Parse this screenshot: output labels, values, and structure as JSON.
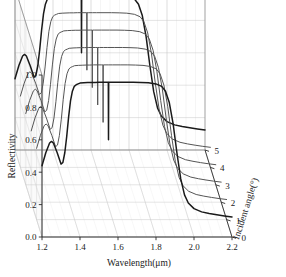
{
  "chart_data": {
    "type": "line",
    "render": "3d-waterfall",
    "title": "",
    "xlabel": "Wavelength(μm)",
    "ylabel": "Reflectivity",
    "zlabel": "Incident angle(°)",
    "xlim": [
      1.2,
      2.2
    ],
    "ylim": [
      0.0,
      1.0
    ],
    "zlim": [
      0,
      5
    ],
    "xticks": [
      "1.2",
      "1.4",
      "1.6",
      "1.8",
      "2.0",
      "2.2"
    ],
    "xtickvals": [
      1.2,
      1.4,
      1.6,
      1.8,
      2.0,
      2.2
    ],
    "yticks": [
      "0.0",
      "0.2",
      "0.4",
      "0.6",
      "0.8",
      "1.0"
    ],
    "ytickvals": [
      0.0,
      0.2,
      0.4,
      0.6,
      0.8,
      1.0
    ],
    "zticks": [
      "0",
      "1",
      "2",
      "3",
      "4",
      "5"
    ],
    "ztickvals": [
      0,
      1,
      2,
      3,
      4,
      5
    ],
    "grid": true,
    "legend": false,
    "line_color": "#222222",
    "notch_wavelength": 1.55,
    "series": [
      {
        "name": "0",
        "angle": 0,
        "color": "#1a1a1a",
        "x": [
          1.2,
          1.22,
          1.24,
          1.25,
          1.26,
          1.28,
          1.3,
          1.31,
          1.32,
          1.33,
          1.34,
          1.35,
          1.36,
          1.37,
          1.38,
          1.39,
          1.4,
          1.42,
          1.44,
          1.46,
          1.48,
          1.5,
          1.52,
          1.54,
          1.549,
          1.55,
          1.551,
          1.56,
          1.58,
          1.6,
          1.64,
          1.68,
          1.72,
          1.76,
          1.8,
          1.83,
          1.85,
          1.87,
          1.89,
          1.91,
          1.93,
          1.95,
          1.97,
          2.0,
          2.04,
          2.08,
          2.12,
          2.16,
          2.2
        ],
        "y": [
          0.44,
          0.52,
          0.58,
          0.59,
          0.58,
          0.52,
          0.45,
          0.46,
          0.52,
          0.62,
          0.74,
          0.84,
          0.9,
          0.93,
          0.94,
          0.945,
          0.95,
          0.952,
          0.953,
          0.954,
          0.954,
          0.955,
          0.955,
          0.955,
          0.955,
          0.6,
          0.955,
          0.955,
          0.955,
          0.955,
          0.955,
          0.955,
          0.954,
          0.952,
          0.945,
          0.93,
          0.9,
          0.83,
          0.7,
          0.52,
          0.36,
          0.26,
          0.21,
          0.175,
          0.155,
          0.145,
          0.137,
          0.13,
          0.124
        ]
      },
      {
        "name": "1",
        "angle": 1,
        "color": "#555555",
        "x": [
          1.2,
          1.22,
          1.24,
          1.25,
          1.26,
          1.28,
          1.3,
          1.31,
          1.32,
          1.33,
          1.34,
          1.35,
          1.36,
          1.37,
          1.38,
          1.39,
          1.4,
          1.42,
          1.44,
          1.46,
          1.48,
          1.5,
          1.52,
          1.54,
          1.549,
          1.55,
          1.551,
          1.56,
          1.58,
          1.6,
          1.64,
          1.68,
          1.72,
          1.76,
          1.8,
          1.83,
          1.85,
          1.87,
          1.89,
          1.91,
          1.93,
          1.95,
          1.97,
          2.0,
          2.04,
          2.08,
          2.12,
          2.16,
          2.2
        ],
        "y": [
          0.44,
          0.52,
          0.58,
          0.59,
          0.58,
          0.52,
          0.45,
          0.46,
          0.52,
          0.62,
          0.74,
          0.84,
          0.9,
          0.93,
          0.94,
          0.945,
          0.95,
          0.952,
          0.953,
          0.954,
          0.954,
          0.955,
          0.955,
          0.955,
          0.955,
          0.6,
          0.955,
          0.955,
          0.955,
          0.955,
          0.955,
          0.955,
          0.954,
          0.952,
          0.945,
          0.93,
          0.9,
          0.83,
          0.7,
          0.52,
          0.36,
          0.26,
          0.21,
          0.175,
          0.155,
          0.145,
          0.137,
          0.13,
          0.124
        ]
      },
      {
        "name": "2",
        "angle": 2,
        "color": "#555555",
        "x": [
          1.2,
          1.22,
          1.24,
          1.25,
          1.26,
          1.28,
          1.3,
          1.31,
          1.32,
          1.33,
          1.34,
          1.35,
          1.36,
          1.37,
          1.38,
          1.39,
          1.4,
          1.42,
          1.44,
          1.46,
          1.48,
          1.5,
          1.52,
          1.54,
          1.549,
          1.55,
          1.551,
          1.56,
          1.58,
          1.6,
          1.64,
          1.68,
          1.72,
          1.76,
          1.8,
          1.83,
          1.85,
          1.87,
          1.89,
          1.91,
          1.93,
          1.95,
          1.97,
          2.0,
          2.04,
          2.08,
          2.12,
          2.16,
          2.2
        ],
        "y": [
          0.44,
          0.52,
          0.58,
          0.59,
          0.58,
          0.52,
          0.45,
          0.46,
          0.52,
          0.62,
          0.74,
          0.84,
          0.9,
          0.93,
          0.94,
          0.945,
          0.95,
          0.952,
          0.953,
          0.954,
          0.954,
          0.955,
          0.955,
          0.955,
          0.955,
          0.6,
          0.955,
          0.955,
          0.955,
          0.955,
          0.955,
          0.955,
          0.954,
          0.952,
          0.945,
          0.93,
          0.9,
          0.83,
          0.7,
          0.52,
          0.36,
          0.26,
          0.21,
          0.175,
          0.155,
          0.145,
          0.137,
          0.13,
          0.124
        ]
      },
      {
        "name": "3",
        "angle": 3,
        "color": "#555555",
        "x": [
          1.2,
          1.22,
          1.24,
          1.25,
          1.26,
          1.28,
          1.3,
          1.31,
          1.32,
          1.33,
          1.34,
          1.35,
          1.36,
          1.37,
          1.38,
          1.39,
          1.4,
          1.42,
          1.44,
          1.46,
          1.48,
          1.5,
          1.52,
          1.54,
          1.549,
          1.55,
          1.551,
          1.56,
          1.58,
          1.6,
          1.64,
          1.68,
          1.72,
          1.76,
          1.8,
          1.83,
          1.85,
          1.87,
          1.89,
          1.91,
          1.93,
          1.95,
          1.97,
          2.0,
          2.04,
          2.08,
          2.12,
          2.16,
          2.2
        ],
        "y": [
          0.44,
          0.52,
          0.58,
          0.59,
          0.58,
          0.52,
          0.45,
          0.46,
          0.52,
          0.62,
          0.74,
          0.84,
          0.9,
          0.93,
          0.94,
          0.945,
          0.95,
          0.952,
          0.953,
          0.954,
          0.954,
          0.955,
          0.955,
          0.955,
          0.955,
          0.6,
          0.955,
          0.955,
          0.955,
          0.955,
          0.955,
          0.955,
          0.954,
          0.952,
          0.945,
          0.93,
          0.9,
          0.83,
          0.7,
          0.52,
          0.36,
          0.26,
          0.21,
          0.175,
          0.155,
          0.145,
          0.137,
          0.13,
          0.124
        ]
      },
      {
        "name": "4",
        "angle": 4,
        "color": "#555555",
        "x": [
          1.2,
          1.22,
          1.24,
          1.25,
          1.26,
          1.28,
          1.3,
          1.31,
          1.32,
          1.33,
          1.34,
          1.35,
          1.36,
          1.37,
          1.38,
          1.39,
          1.4,
          1.42,
          1.44,
          1.46,
          1.48,
          1.5,
          1.52,
          1.54,
          1.549,
          1.55,
          1.551,
          1.56,
          1.58,
          1.6,
          1.64,
          1.68,
          1.72,
          1.76,
          1.8,
          1.83,
          1.85,
          1.87,
          1.89,
          1.91,
          1.93,
          1.95,
          1.97,
          2.0,
          2.04,
          2.08,
          2.12,
          2.16,
          2.2
        ],
        "y": [
          0.44,
          0.52,
          0.58,
          0.59,
          0.58,
          0.52,
          0.45,
          0.46,
          0.52,
          0.62,
          0.74,
          0.84,
          0.9,
          0.93,
          0.94,
          0.945,
          0.95,
          0.952,
          0.953,
          0.954,
          0.954,
          0.955,
          0.955,
          0.955,
          0.955,
          0.6,
          0.955,
          0.955,
          0.955,
          0.955,
          0.955,
          0.955,
          0.954,
          0.952,
          0.945,
          0.93,
          0.9,
          0.83,
          0.7,
          0.52,
          0.36,
          0.26,
          0.21,
          0.175,
          0.155,
          0.145,
          0.137,
          0.13,
          0.124
        ]
      },
      {
        "name": "5",
        "angle": 5,
        "color": "#1a1a1a",
        "x": [
          1.2,
          1.22,
          1.24,
          1.25,
          1.26,
          1.28,
          1.3,
          1.31,
          1.32,
          1.33,
          1.34,
          1.35,
          1.36,
          1.37,
          1.38,
          1.39,
          1.4,
          1.42,
          1.44,
          1.46,
          1.48,
          1.5,
          1.52,
          1.54,
          1.549,
          1.55,
          1.551,
          1.56,
          1.58,
          1.6,
          1.64,
          1.68,
          1.72,
          1.76,
          1.8,
          1.83,
          1.85,
          1.87,
          1.89,
          1.91,
          1.93,
          1.95,
          1.97,
          2.0,
          2.04,
          2.08,
          2.12,
          2.16,
          2.2
        ],
        "y": [
          0.44,
          0.52,
          0.58,
          0.59,
          0.58,
          0.52,
          0.45,
          0.46,
          0.52,
          0.62,
          0.74,
          0.84,
          0.9,
          0.93,
          0.94,
          0.945,
          0.95,
          0.952,
          0.953,
          0.954,
          0.954,
          0.955,
          0.955,
          0.955,
          0.955,
          0.6,
          0.955,
          0.955,
          0.955,
          0.955,
          0.955,
          0.955,
          0.954,
          0.952,
          0.945,
          0.93,
          0.9,
          0.83,
          0.7,
          0.52,
          0.36,
          0.26,
          0.21,
          0.175,
          0.155,
          0.145,
          0.137,
          0.13,
          0.124
        ]
      }
    ]
  }
}
